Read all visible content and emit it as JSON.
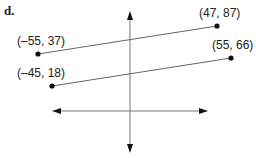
{
  "figure": {
    "part_label": "d.",
    "segments": [
      {
        "start": {
          "label": "(–55, 37)",
          "x": -55,
          "y": 37
        },
        "end": {
          "label": "(47, 87)",
          "x": 47,
          "y": 87
        }
      },
      {
        "start": {
          "label": "(–45, 18)",
          "x": -45,
          "y": 18
        },
        "end": {
          "label": "(55, 66)",
          "x": 55,
          "y": 66
        }
      }
    ],
    "axes": {
      "x_axis": "horizontal double-arrow",
      "y_axis": "vertical double-arrow"
    },
    "colors": {
      "line": "#555555",
      "axis": "#666666",
      "point": "#111111",
      "text": "#222222"
    }
  }
}
